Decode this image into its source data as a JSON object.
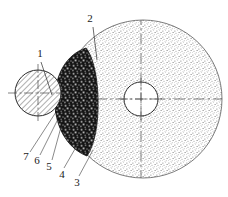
{
  "figure": {
    "type": "technical-cross-section-diagram",
    "width": 228,
    "height": 197,
    "background": "#ffffff",
    "ink": "#1a1a1a"
  },
  "callouts": [
    {
      "id": "1",
      "label": "1",
      "x": 40,
      "y": 57,
      "leader_to_x": 55,
      "leader_to_y": 92,
      "target": "hatched-roller"
    },
    {
      "id": "2",
      "label": "2",
      "x": 90,
      "y": 22,
      "leader_to_x": 96,
      "leader_to_y": 56,
      "target": "stippled-wheel"
    },
    {
      "id": "3",
      "label": "3",
      "x": 77,
      "y": 182,
      "leader_to_x": 92,
      "leader_to_y": 152,
      "target": "wheel-body"
    },
    {
      "id": "4",
      "label": "4",
      "x": 62,
      "y": 174,
      "leader_to_x": 79,
      "leader_to_y": 144,
      "target": "contact-lens"
    },
    {
      "id": "5",
      "label": "5",
      "x": 49,
      "y": 166,
      "leader_to_x": 60,
      "leader_to_y": 128,
      "target": "layer-5"
    },
    {
      "id": "6",
      "label": "6",
      "x": 37,
      "y": 161,
      "leader_to_x": 58,
      "leader_to_y": 120,
      "target": "layer-6"
    },
    {
      "id": "7",
      "label": "7",
      "x": 26,
      "y": 157,
      "leader_to_x": 56,
      "leader_to_y": 113,
      "target": "layer-7"
    }
  ],
  "parts": {
    "hatched_roller": {
      "name": "hatched-roller",
      "cx": 38,
      "cy": 93,
      "r": 23,
      "fill": "diagonal-hatch",
      "stroke": "#2b2b2b"
    },
    "stippled_wheel": {
      "name": "stippled-wheel",
      "cx": 143,
      "cy": 99,
      "r": 79,
      "fill": "fine-stipple",
      "stroke": "#555555"
    },
    "wheel_bore": {
      "name": "wheel-bore",
      "cx": 141,
      "cy": 99,
      "r": 17,
      "fill": "#ffffff",
      "stroke": "#2b2b2b"
    },
    "contact_lens": {
      "name": "contact-lens-zone",
      "fill": "coarse-granular-dark",
      "note": "dark crescent between roller and wheel"
    }
  },
  "centerlines": {
    "roller_horizontal": {
      "x1": 8,
      "y1": 93,
      "x2": 70,
      "y2": 93
    },
    "roller_vertical": {
      "x1": 38,
      "y1": 64,
      "x2": 38,
      "y2": 122
    },
    "wheel_horizontal": {
      "x1": 104,
      "y1": 99,
      "x2": 224,
      "y2": 99
    },
    "wheel_vertical": {
      "x1": 141,
      "y1": 16,
      "x2": 141,
      "y2": 180
    }
  },
  "icons": {
    "hatch": "diagonal-hatch-icon",
    "stipple": "stipple-texture-icon",
    "granular": "granular-texture-icon"
  }
}
